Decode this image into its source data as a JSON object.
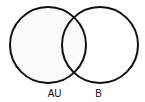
{
  "diagram": {
    "type": "venn",
    "background": "#ffffff",
    "stroke_color": "#111111",
    "fill_color": "#fafafa",
    "circles": [
      {
        "id": "left",
        "cx": 48,
        "cy": 45,
        "r": 38
      },
      {
        "id": "right",
        "cx": 100,
        "cy": 45,
        "r": 38
      }
    ],
    "labels": [
      {
        "text": "AU",
        "x": 47,
        "y": 88
      },
      {
        "text": "B",
        "x": 95,
        "y": 88
      }
    ]
  }
}
